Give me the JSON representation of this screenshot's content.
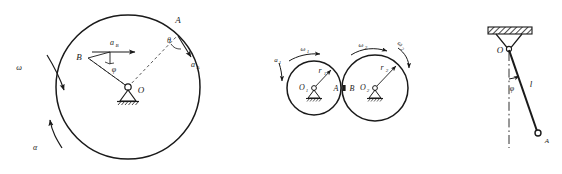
{
  "sheet": {
    "title": "Mechanics figure sheet",
    "background_color": "#ffffff",
    "ink_color": "#1a1a1a",
    "figure_count": 3
  },
  "figure_a": {
    "name": "rotating-disk-with-accelerations",
    "description": "Large circle rotating about fixed pin support O with angular velocity and angular acceleration; acceleration vectors at points A and B",
    "labels": {
      "center": "O",
      "point_a": "A",
      "point_b": "B",
      "accel_a": "a",
      "accel_a_sub": "A",
      "accel_b": "a",
      "accel_b_sub": "B",
      "angle_theta": "θ",
      "angle_phi": "φ",
      "omega": "ω",
      "alpha": "α"
    },
    "geometry": {
      "circle_center_x": 128,
      "circle_center_y": 87,
      "circle_radius": 72,
      "pivot_x": 128,
      "pivot_y": 87,
      "point_a_x": 178,
      "point_a_y": 35,
      "point_b_x": 88,
      "point_b_y": 58
    }
  },
  "figure_b": {
    "name": "two-meshing-wheels",
    "description": "Two tangent wheels on pin supports rotating with angular velocities; contact points A and B",
    "labels": {
      "center_1": "O",
      "center_1_sub": "1",
      "center_2": "O",
      "center_2_sub": "2",
      "radius_1": "r",
      "radius_1_sub": "1",
      "radius_2": "r",
      "radius_2_sub": "2",
      "point_a": "A",
      "point_b": "B",
      "omega_1": "ω",
      "omega_1_sub": "1",
      "omega_2": "ω",
      "omega_2_sub": "2",
      "omega_3": "ω",
      "omega_3_sub": "2",
      "accel_left": "a",
      "accel_left_sub": "1"
    },
    "geometry": {
      "circle1_center_x": 314,
      "circle1_center_y": 88,
      "circle1_radius": 27,
      "circle2_center_x": 375,
      "circle2_center_y": 88,
      "circle2_radius": 33,
      "contact_x": 344,
      "contact_y": 88
    }
  },
  "figure_c": {
    "name": "simple-pendulum",
    "description": "Pendulum suspended from hatched ceiling at pivot O, rod of length l at angle phi from vertical, bob at A",
    "labels": {
      "pivot": "O",
      "length": "l",
      "angle_phi": "φ",
      "bob": "A"
    },
    "geometry": {
      "ceiling_x": 488,
      "ceiling_y": 27,
      "ceiling_width": 44,
      "ceiling_height": 7,
      "pivot_x": 509,
      "pivot_y": 50,
      "bob_x": 538,
      "bob_y": 133,
      "vertical_end_y": 148
    }
  }
}
